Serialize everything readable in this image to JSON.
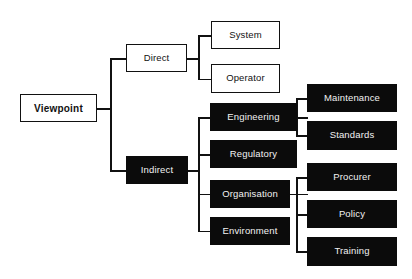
{
  "diagram": {
    "colors": {
      "background": "#ffffff",
      "line": "#111111",
      "white_node_fill": "#ffffff",
      "white_node_text": "#111111",
      "black_node_fill": "#0b0b0b",
      "black_node_text": "#f2f2f2"
    },
    "nodes": {
      "root": {
        "label": "Viewpoint",
        "style": "white"
      },
      "direct": {
        "label": "Direct",
        "style": "white"
      },
      "indirect": {
        "label": "Indirect",
        "style": "black"
      },
      "system": {
        "label": "System",
        "style": "white"
      },
      "operator": {
        "label": "Operator",
        "style": "white"
      },
      "engineering": {
        "label": "Engineering",
        "style": "black"
      },
      "regulatory": {
        "label": "Regulatory",
        "style": "black"
      },
      "organisation": {
        "label": "Organisation",
        "style": "black"
      },
      "environment": {
        "label": "Environment",
        "style": "black"
      },
      "maintenance": {
        "label": "Maintenance",
        "style": "black"
      },
      "standards": {
        "label": "Standards",
        "style": "black"
      },
      "procurer": {
        "label": "Procurer",
        "style": "black"
      },
      "policy": {
        "label": "Policy",
        "style": "black"
      },
      "training": {
        "label": "Training",
        "style": "black"
      }
    }
  }
}
